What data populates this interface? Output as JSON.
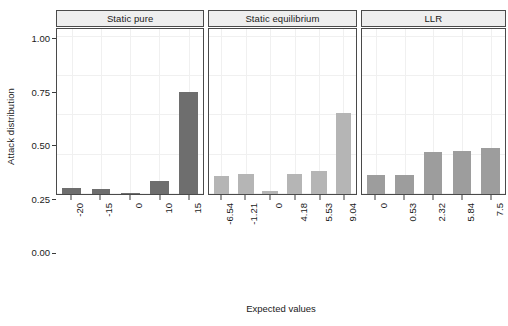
{
  "chart_data": {
    "type": "bar",
    "title": "",
    "xlabel": "Expected values",
    "ylabel": "Attack distribution",
    "ylim": [
      0,
      1.05
    ],
    "yticks": [
      0.0,
      0.25,
      0.5,
      0.75,
      1.0
    ],
    "ytick_labels": [
      "0.00",
      "0.25",
      "0.50",
      "0.75",
      "1.00"
    ],
    "grid": true,
    "legend": "none",
    "facet_layout": "1x3 horizontal panels, shared y-axis",
    "panels": [
      {
        "label": "Static pure",
        "bar_color": "#6e6e6e",
        "categories": [
          "-20",
          "-15",
          "0",
          "10",
          "15"
        ],
        "values": [
          0.04,
          0.035,
          0.005,
          0.085,
          0.65
        ]
      },
      {
        "label": "Static equilibrium",
        "bar_color": "#b5b5b5",
        "categories": [
          "-6.54",
          "-1.21",
          "0",
          "4.18",
          "5.53",
          "9.04"
        ],
        "values": [
          0.115,
          0.13,
          0.02,
          0.125,
          0.145,
          0.515
        ]
      },
      {
        "label": "LLR",
        "bar_color": "#9d9d9d",
        "categories": [
          "0",
          "0.53",
          "2.32",
          "5.84",
          "7.5"
        ],
        "values": [
          0.12,
          0.12,
          0.265,
          0.275,
          0.295
        ]
      }
    ]
  }
}
